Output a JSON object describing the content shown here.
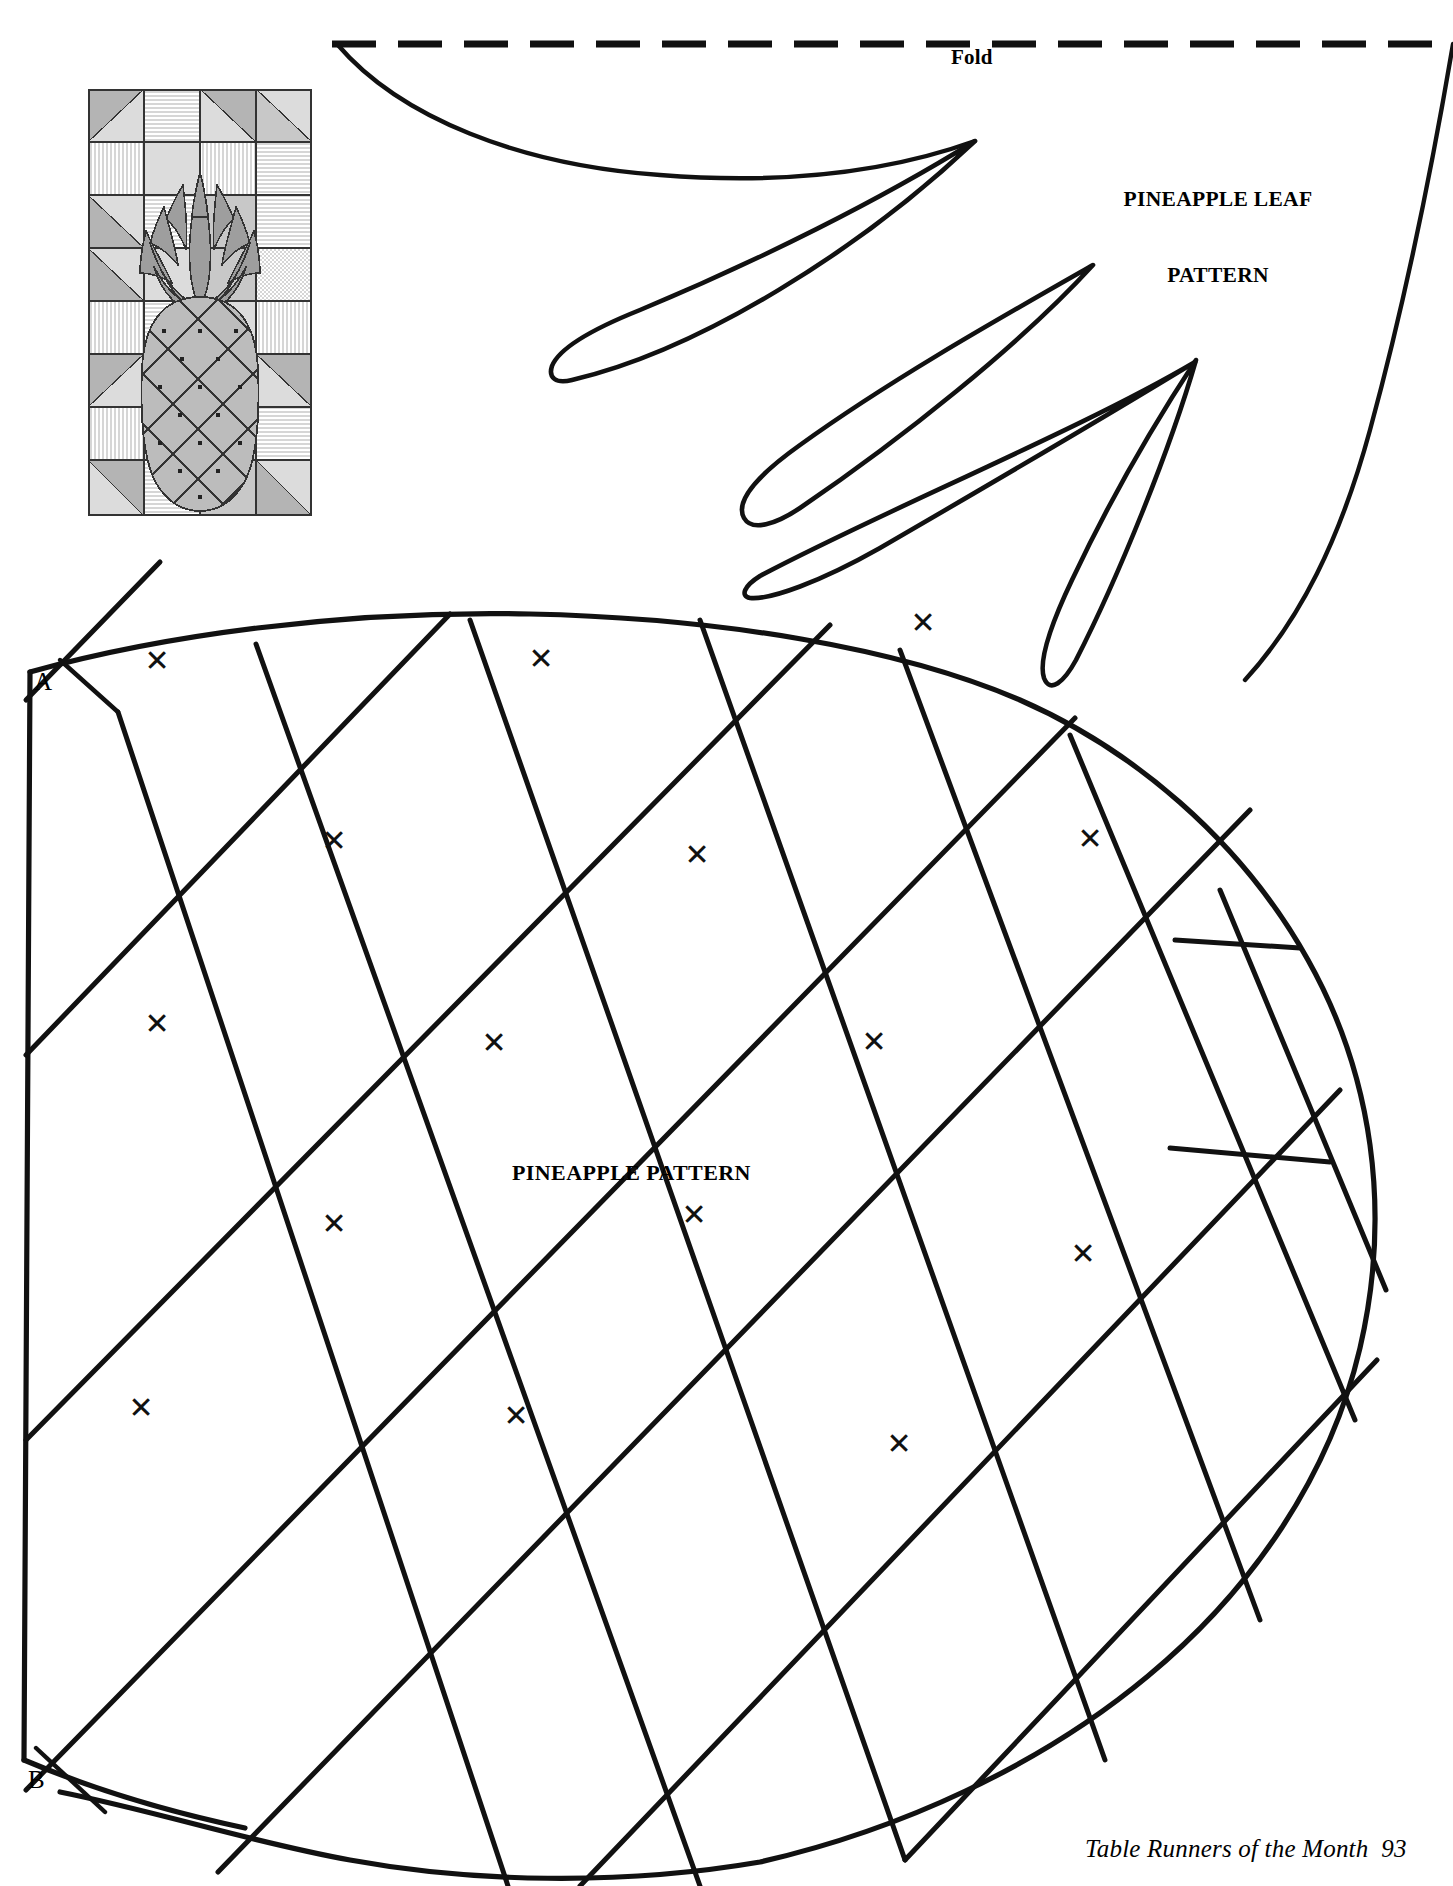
{
  "page": {
    "width": 1453,
    "height": 1886,
    "background": "#ffffff",
    "ink_color": "#111111"
  },
  "labels": {
    "fold": "Fold",
    "leaf_title_line1": "PINEAPPLE LEAF",
    "leaf_title_line2": "PATTERN",
    "body_title": "PINEAPPLE PATTERN",
    "mark_a": "A",
    "mark_b": "B",
    "footer": "Table Runners of the Month  93"
  },
  "icons": {
    "quilting_mark": "x-mark-icon"
  },
  "quilting_marks": [
    {
      "x": 157,
      "y": 661
    },
    {
      "x": 541,
      "y": 659
    },
    {
      "x": 923,
      "y": 623
    },
    {
      "x": 334,
      "y": 841
    },
    {
      "x": 697,
      "y": 855
    },
    {
      "x": 1090,
      "y": 839
    },
    {
      "x": 157,
      "y": 1024
    },
    {
      "x": 494,
      "y": 1043
    },
    {
      "x": 874,
      "y": 1042
    },
    {
      "x": 334,
      "y": 1224
    },
    {
      "x": 694,
      "y": 1215
    },
    {
      "x": 1083,
      "y": 1254
    },
    {
      "x": 141,
      "y": 1408
    },
    {
      "x": 516,
      "y": 1416
    },
    {
      "x": 899,
      "y": 1444
    }
  ],
  "thumbnail": {
    "name": "quilt-block-preview",
    "palette": {
      "light": "#dcdcdc",
      "mid": "#c0c0c0",
      "dark": "#a8a8a8",
      "stripe_bg": "#d6d6d6",
      "stripe_fg": "#ffffff",
      "applique_body": "#c2c2c2",
      "applique_leaf": "#9e9e9e",
      "outline": "#333333"
    },
    "description": "Pineapple applique table runner block with pieced patchwork border"
  },
  "chart_data": {
    "type": "table",
    "title": "PINEAPPLE PATTERN",
    "note": "Applique pattern template sheet"
  }
}
